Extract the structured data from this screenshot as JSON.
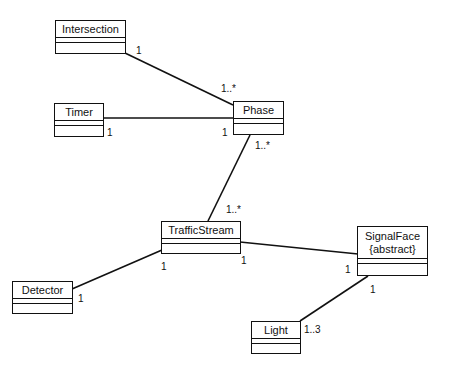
{
  "diagram": {
    "type": "UML class diagram",
    "classes": [
      {
        "id": "intersection",
        "name": "Intersection",
        "stereotype": "",
        "x": 55,
        "y": 20,
        "w": 71,
        "h": 34
      },
      {
        "id": "timer",
        "name": "Timer",
        "stereotype": "",
        "x": 54,
        "y": 103,
        "w": 50,
        "h": 34
      },
      {
        "id": "phase",
        "name": "Phase",
        "stereotype": "",
        "x": 233,
        "y": 101,
        "w": 51,
        "h": 34
      },
      {
        "id": "trafficstream",
        "name": "TrafficStream",
        "stereotype": "",
        "x": 161,
        "y": 221,
        "w": 80,
        "h": 33
      },
      {
        "id": "signalface",
        "name": "SignalFace",
        "stereotype": "{abstract}",
        "x": 357,
        "y": 226,
        "w": 71,
        "h": 50
      },
      {
        "id": "detector",
        "name": "Detector",
        "stereotype": "",
        "x": 12,
        "y": 281,
        "w": 61,
        "h": 33
      },
      {
        "id": "light",
        "name": "Light",
        "stereotype": "",
        "x": 251,
        "y": 321,
        "w": 50,
        "h": 33
      }
    ],
    "associations": [
      {
        "from": "Intersection",
        "to": "Phase",
        "from_mult": "1",
        "to_mult": "1..*"
      },
      {
        "from": "Timer",
        "to": "Phase",
        "from_mult": "1",
        "to_mult": "1"
      },
      {
        "from": "Phase",
        "to": "TrafficStream",
        "from_mult": "1..*",
        "to_mult": "1..*"
      },
      {
        "from": "TrafficStream",
        "to": "SignalFace",
        "from_mult": "1",
        "to_mult": "1"
      },
      {
        "from": "Detector",
        "to": "TrafficStream",
        "from_mult": "1",
        "to_mult": "1"
      },
      {
        "from": "SignalFace",
        "to": "Light",
        "from_mult": "1",
        "to_mult": "1..3"
      }
    ],
    "multiplicity_labels": {
      "intersection_phase_a": "1",
      "intersection_phase_b": "1..*",
      "timer_phase_a": "1",
      "timer_phase_b": "1",
      "phase_ts_a": "1..*",
      "phase_ts_b": "1..*",
      "ts_sf_a": "1",
      "ts_sf_b": "1",
      "det_ts_a": "1",
      "det_ts_b": "1",
      "sf_light_a": "1",
      "sf_light_b": "1..3"
    }
  }
}
